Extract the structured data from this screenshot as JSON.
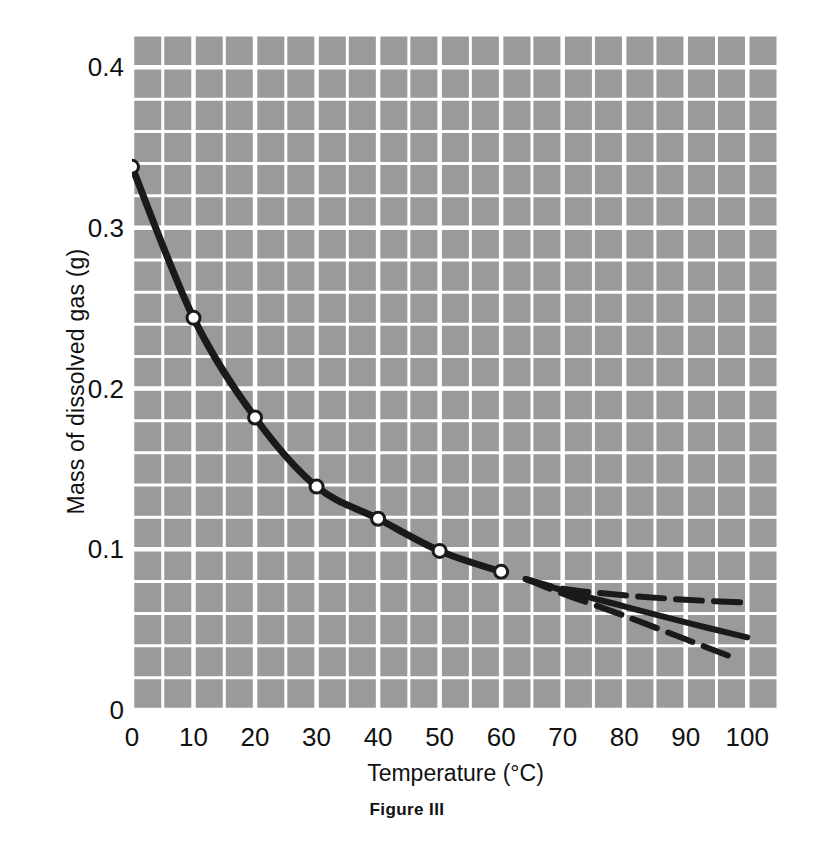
{
  "figure": {
    "caption": "Figure III"
  },
  "chart_data": {
    "type": "line",
    "title": "",
    "xlabel": "Temperature (°C)",
    "ylabel": "Mass of dissolved gas (g)",
    "xlim": [
      0,
      105
    ],
    "ylim": [
      0,
      0.42
    ],
    "grid": true,
    "grid_color": "#ffffff",
    "plot_background": "#9a9a9a",
    "line_color": "#1a1a1a",
    "marker_face_color": "#ffffff",
    "marker_edge_color": "#1a1a1a",
    "legend": "none",
    "xticks": [
      0,
      10,
      20,
      30,
      40,
      50,
      60,
      70,
      80,
      90,
      100
    ],
    "xtick_labels": [
      "0",
      "10",
      "20",
      "30",
      "40",
      "50",
      "60",
      "70",
      "80",
      "90",
      "100"
    ],
    "yticks": [
      0,
      0.1,
      0.2,
      0.3,
      0.4
    ],
    "ytick_labels": [
      "0",
      "0.1",
      "0.2",
      "0.3",
      "0.4"
    ],
    "x_minor_step": 5,
    "y_minor_step": 0.02,
    "series": [
      {
        "name": "measured solubility",
        "style": "solid",
        "markers": true,
        "x": [
          0,
          10,
          20,
          30,
          40,
          50,
          60
        ],
        "y": [
          0.338,
          0.244,
          0.182,
          0.139,
          0.119,
          0.099,
          0.086
        ]
      },
      {
        "name": "extrapolation upper",
        "style": "dashed",
        "markers": false,
        "x": [
          64,
          70,
          80,
          90,
          100
        ],
        "y": [
          0.0815,
          0.0755,
          0.0714,
          0.0686,
          0.0668
        ]
      },
      {
        "name": "extrapolation middle",
        "style": "solid",
        "markers": false,
        "x": [
          64,
          70,
          80,
          90,
          100
        ],
        "y": [
          0.0815,
          0.0745,
          0.0645,
          0.0545,
          0.0452
        ]
      },
      {
        "name": "extrapolation lower",
        "style": "dashed",
        "markers": false,
        "x": [
          64,
          70,
          80,
          90,
          97
        ],
        "y": [
          0.0815,
          0.0724,
          0.0587,
          0.044,
          0.0337
        ]
      }
    ]
  }
}
